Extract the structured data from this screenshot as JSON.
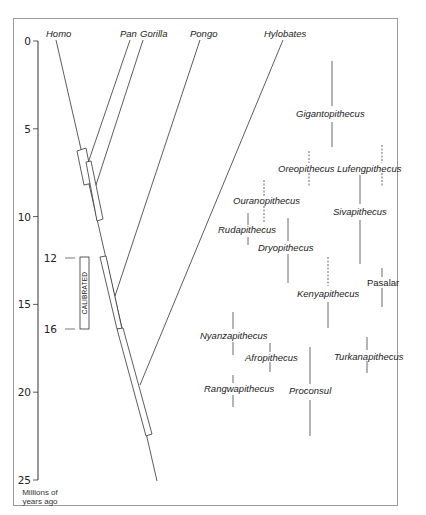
{
  "axis": {
    "unit_label_line1": "Millions of",
    "unit_label_line2": "years ago",
    "ticks": [
      "0",
      "5",
      "10",
      "15",
      "20",
      "25"
    ],
    "tick_values": [
      0,
      5,
      10,
      15,
      20,
      25
    ],
    "range": [
      0,
      25
    ]
  },
  "calibration": {
    "label": "CALIBRATED",
    "start_label": "12",
    "end_label": "16",
    "start": 12,
    "end": 16
  },
  "lineages": [
    {
      "name": "Homo",
      "tip_ma": 0
    },
    {
      "name": "Pan",
      "tip_ma": 0
    },
    {
      "name": "Gorilla",
      "tip_ma": 0
    },
    {
      "name": "Pongo",
      "tip_ma": 0
    },
    {
      "name": "Hylobates",
      "tip_ma": 0
    }
  ],
  "divergences": [
    {
      "between": "Pan–Homo",
      "range_ma": [
        6.0,
        8.0
      ]
    },
    {
      "between": "Gorilla–Homo",
      "range_ma": [
        7.5,
        10.0
      ]
    },
    {
      "between": "Pongo–Homo",
      "range_ma": [
        12.0,
        16.0
      ]
    },
    {
      "between": "Hylobates–Homo",
      "range_ma": [
        16.0,
        22.0
      ]
    },
    {
      "root_ma": 25
    }
  ],
  "fossils": [
    {
      "name": "Gigantopithecus",
      "range_ma": [
        1.0,
        8.5
      ],
      "style": "solid"
    },
    {
      "name": "Oreopithecus",
      "range_ma": [
        6.0,
        8.0
      ],
      "style": "dashed"
    },
    {
      "name": "Lufengpithecus",
      "range_ma": [
        6.0,
        8.0
      ],
      "style": "dashed"
    },
    {
      "name": "Sivapithecus",
      "range_ma": [
        7.0,
        12.5
      ],
      "style": "solid"
    },
    {
      "name": "Ouranopithecus",
      "range_ma": [
        8.5,
        10.5
      ],
      "style": "dashed"
    },
    {
      "name": "Rudapithecus",
      "range_ma": [
        9.5,
        11.5
      ],
      "style": "solid"
    },
    {
      "name": "Dryopithecus",
      "range_ma": [
        10.0,
        13.5
      ],
      "style": "solid"
    },
    {
      "name": "Kenyapithecus",
      "range_ma": [
        12.5,
        16.0
      ],
      "style": "mixed"
    },
    {
      "name": "Pasalar",
      "range_ma": [
        12.5,
        15.5
      ],
      "style": "solid"
    },
    {
      "name": "Nyanzapithecus",
      "range_ma": [
        15.0,
        18.0
      ],
      "style": "solid"
    },
    {
      "name": "Afropithecus",
      "range_ma": [
        17.0,
        18.5
      ],
      "style": "solid"
    },
    {
      "name": "Turkanapithecus",
      "range_ma": [
        16.5,
        18.5
      ],
      "style": "solid"
    },
    {
      "name": "Rangwapithecus",
      "range_ma": [
        18.5,
        20.5
      ],
      "style": "solid"
    },
    {
      "name": "Proconsul",
      "range_ma": [
        17.0,
        22.0
      ],
      "style": "solid"
    }
  ]
}
